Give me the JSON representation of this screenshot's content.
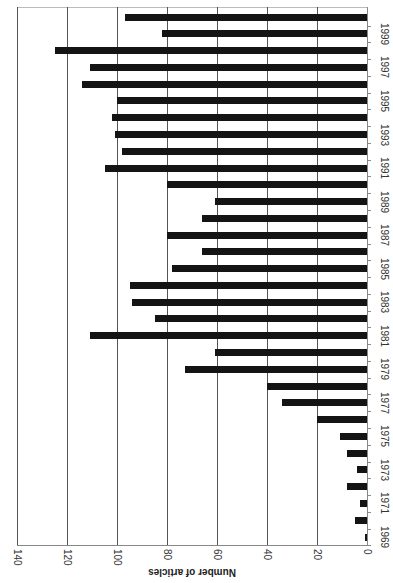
{
  "chart_data": {
    "type": "bar",
    "orientation": "vertical chart rendered rotated 90 degrees clockwise",
    "title": "",
    "xlabel": "",
    "ylabel": "Number of articles",
    "ylim": [
      0,
      140
    ],
    "yticks": [
      0,
      20,
      40,
      60,
      80,
      100,
      120,
      140
    ],
    "grid": true,
    "legend": "none",
    "categories": [
      1969,
      1970,
      1971,
      1972,
      1973,
      1974,
      1975,
      1976,
      1977,
      1978,
      1979,
      1980,
      1981,
      1982,
      1983,
      1984,
      1985,
      1986,
      1987,
      1988,
      1989,
      1990,
      1991,
      1992,
      1993,
      1994,
      1995,
      1996,
      1997,
      1998,
      1999,
      2000
    ],
    "category_tick_labels": [
      "1969",
      "1971",
      "1973",
      "1975",
      "1977",
      "1979",
      "1981",
      "1983",
      "1985",
      "1987",
      "1989",
      "1991",
      "1993",
      "1995",
      "1997",
      "1999"
    ],
    "values": [
      1,
      5,
      3,
      8,
      4,
      8,
      11,
      20,
      34,
      40,
      73,
      61,
      111,
      85,
      94,
      95,
      78,
      66,
      80,
      66,
      61,
      80,
      105,
      98,
      101,
      102,
      100,
      114,
      111,
      125,
      82,
      97
    ],
    "bar_color": "#141414"
  },
  "axis": {
    "title": "Number of articles",
    "tick_labels": [
      "0",
      "20",
      "40",
      "60",
      "80",
      "100",
      "120",
      "140"
    ]
  }
}
